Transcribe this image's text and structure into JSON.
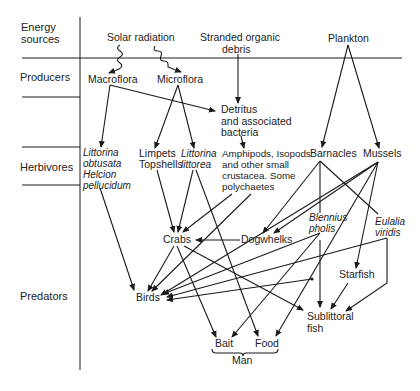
{
  "diagram": {
    "type": "food-web",
    "levels": [
      {
        "id": "energy",
        "label_line1": "Energy",
        "label_line2": "sources"
      },
      {
        "id": "producers",
        "label": "Producers"
      },
      {
        "id": "herbivores",
        "label": "Herbivores"
      },
      {
        "id": "predators",
        "label": "Predators"
      }
    ],
    "nodes": {
      "solar": {
        "label": "Solar radiation"
      },
      "debris": {
        "line1": "Stranded organic",
        "line2": "debris"
      },
      "plankton": {
        "label": "Plankton"
      },
      "macroflora": {
        "label": "Macroflora"
      },
      "microflora": {
        "label": "Microflora"
      },
      "detritus": {
        "line1": "Detritus",
        "line2": "and associated",
        "line3": "bacteria"
      },
      "littorina_obtusata": {
        "line1": "Littorina",
        "line2": "obtusata",
        "line3": "Helcion",
        "line4": "pellucidum"
      },
      "limpets": {
        "line1": "Limpets",
        "line2": "Topshells"
      },
      "littorina_littorea": {
        "line1": "Littorina",
        "line2": "littorea"
      },
      "amphipods": {
        "line1": "Amphipods, Isopods",
        "line2": "and other small",
        "line3": "crustacea. Some",
        "line4": "polychaetes"
      },
      "barnacles": {
        "label": "Barnacles"
      },
      "mussels": {
        "label": "Mussels"
      },
      "blennius": {
        "line1": "Blennius",
        "line2": "pholis"
      },
      "eulalia": {
        "line1": "Eulalia",
        "line2": "viridis"
      },
      "crabs": {
        "label": "Crabs"
      },
      "dogwhelks": {
        "label": "Dogwhelks"
      },
      "birds": {
        "label": "Birds"
      },
      "starfish": {
        "label": "Starfish"
      },
      "sublittoral": {
        "line1": "Sublittoral",
        "line2": "fish"
      },
      "bait": {
        "label": "Bait"
      },
      "food": {
        "label": "Food"
      },
      "man": {
        "label": "Man"
      }
    },
    "edges": [
      [
        "solar",
        "macroflora"
      ],
      [
        "solar",
        "microflora"
      ],
      [
        "debris",
        "detritus"
      ],
      [
        "plankton",
        "barnacles"
      ],
      [
        "plankton",
        "mussels"
      ],
      [
        "macroflora",
        "detritus"
      ],
      [
        "macroflora",
        "littorina_obtusata"
      ],
      [
        "microflora",
        "limpets"
      ],
      [
        "microflora",
        "littorina_littorea"
      ],
      [
        "detritus",
        "amphipods"
      ],
      [
        "littorina_obtusata",
        "birds"
      ],
      [
        "limpets",
        "crabs"
      ],
      [
        "littorina_littorea",
        "crabs"
      ],
      [
        "littorina_littorea",
        "food"
      ],
      [
        "amphipods",
        "crabs"
      ],
      [
        "amphipods",
        "birds"
      ],
      [
        "barnacles",
        "dogwhelks"
      ],
      [
        "barnacles",
        "blennius"
      ],
      [
        "barnacles",
        "eulalia"
      ],
      [
        "mussels",
        "dogwhelks"
      ],
      [
        "mussels",
        "starfish"
      ],
      [
        "mussels",
        "bait"
      ],
      [
        "mussels",
        "food"
      ],
      [
        "mussels",
        "birds"
      ],
      [
        "dogwhelks",
        "crabs"
      ],
      [
        "crabs",
        "birds"
      ],
      [
        "crabs",
        "bait"
      ],
      [
        "crabs",
        "sublittoral"
      ],
      [
        "blennius",
        "birds"
      ],
      [
        "blennius",
        "sublittoral"
      ],
      [
        "blennius",
        "bait"
      ],
      [
        "eulalia",
        "birds"
      ],
      [
        "eulalia",
        "sublittoral"
      ],
      [
        "starfish",
        "sublittoral"
      ]
    ]
  }
}
